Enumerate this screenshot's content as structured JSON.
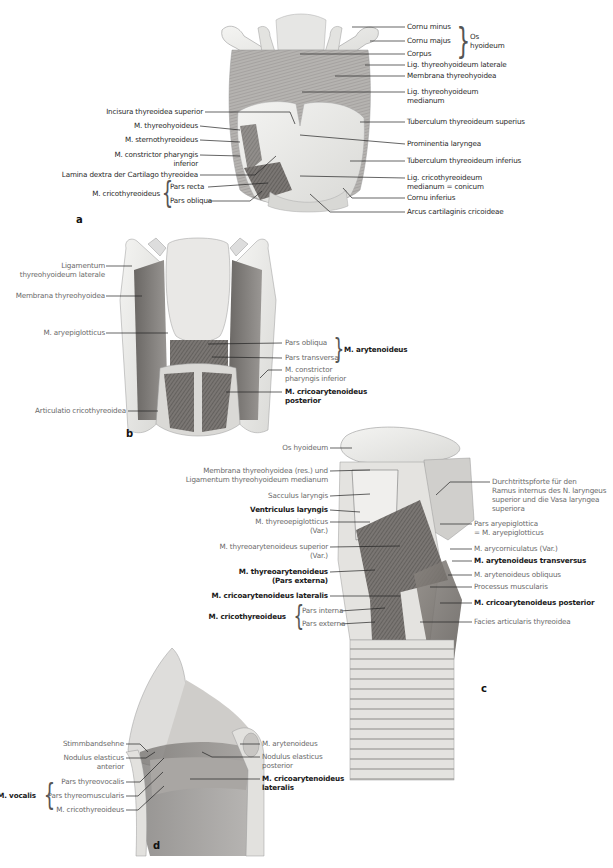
{
  "figure": {
    "panels": [
      {
        "letter": "a",
        "labels_right": [
          "Cornu minus",
          "Cornu majus",
          "Corpus",
          "Lig. thyreohyoideum laterale",
          "Membrana thyreohyoidea",
          "Lig. thyreohyoideum",
          "medianum",
          "Tuberculum thyreoideum superius",
          "Prominentia laryngea",
          "Tuberculum thyreoideum inferius",
          "Lig. cricothyreoideum",
          "medianum = conicum",
          "Cornu inferius",
          "Arcus cartilaginis cricoideae"
        ],
        "group_os": [
          "Os",
          "hyoideum"
        ],
        "labels_left": [
          "Incisura thyreoidea superior",
          "M. thyreohyoideus",
          "M. sternothyreoideus",
          "M. constrictor pharyngis",
          "inferior",
          "Lamina dextra der Cartilago thyreoidea"
        ],
        "cricothyreoideus": {
          "group": "M. cricothyreoideus",
          "parts": [
            "Pars recta",
            "Pars obliqua"
          ]
        }
      },
      {
        "letter": "b",
        "labels_left": [
          "Ligamentum",
          "thyreohyoideum laterale",
          "Membrana thyreohyoidea",
          "M. aryepiglotticus",
          "Articulatio cricothyreoidea"
        ],
        "arytenoideus": {
          "parts": [
            "Pars obliqua",
            "Pars transversa"
          ],
          "group": "M. arytenoideus"
        },
        "labels_right": [
          "M. constrictor",
          "pharyngis inferior",
          "M. cricoarytenoideus",
          "posterior"
        ]
      },
      {
        "letter": "c",
        "labels_left": [
          "Os hyoideum",
          "Membrana thyreohyoidea (res.) und",
          "Ligamentum thyreohyoideum medianum",
          "Sacculus laryngis",
          "Ventriculus laryngis",
          "M. thyreoepiglotticus",
          "(Var.)",
          "M. thyreoarytenoideus superior",
          "(Var.)",
          "M. thyreoarytenoideus",
          "(Pars externa)",
          "M. cricoarytenoideus lateralis"
        ],
        "cricothyreoideus": {
          "group": "M. cricothyreoideus",
          "parts": [
            "Pars interna",
            "Pars externa"
          ]
        },
        "labels_right": [
          "Durchtrittspforte für den",
          "Ramus internus des N. laryngeus",
          "superior und die Vasa laryngea",
          "superiora",
          "Pars aryepiglottica",
          "= M. aryepiglotticus",
          "M. arycorniculatus (Var.)",
          "M. arytenoideus transversus",
          "M. arytenoideus obliquus",
          "Processus muscularis",
          "M. cricoarytenoideus posterior",
          "Facies articularis thyreoidea"
        ]
      },
      {
        "letter": "d",
        "labels_left": [
          "Stimmbandsehne",
          "Nodulus elasticus",
          "anterior",
          "M. cricothyreoideus"
        ],
        "vocalis": {
          "group": "M. vocalis",
          "parts": [
            "Pars thyreovocalis",
            "Pars thyreomuscularis"
          ]
        },
        "labels_right": [
          "M. arytenoideus",
          "Nodulus elasticus",
          "posterior",
          "M. cricoarytenoideus",
          "lateralis"
        ]
      }
    ]
  }
}
